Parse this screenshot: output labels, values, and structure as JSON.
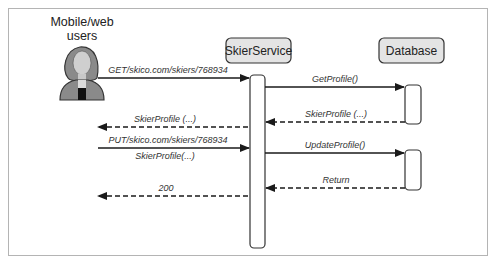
{
  "diagram": {
    "type": "sequence",
    "actor": {
      "label_line1": "Mobile/web",
      "label_line2": "users",
      "icon": "user-icon"
    },
    "participants": [
      {
        "id": "skierservice",
        "label": "SkierService"
      },
      {
        "id": "database",
        "label": "Database"
      }
    ],
    "messages": [
      {
        "from": "users",
        "to": "SkierService",
        "label": "GET/skico.com/skiers/768934",
        "style": "solid"
      },
      {
        "from": "SkierService",
        "to": "Database",
        "label": "GetProfile()",
        "style": "solid"
      },
      {
        "from": "Database",
        "to": "SkierService",
        "label": "SkierProfile (...)",
        "style": "dashed"
      },
      {
        "from": "SkierService",
        "to": "users",
        "label": "SkierProfile (...)",
        "style": "dashed"
      },
      {
        "from": "users",
        "to": "SkierService",
        "label": "PUT/skico.com/skiers/768934",
        "sublabel": "SkierProfile(...)",
        "style": "solid"
      },
      {
        "from": "SkierService",
        "to": "Database",
        "label": "UpdateProfile()",
        "style": "solid"
      },
      {
        "from": "Database",
        "to": "SkierService",
        "label": "Return",
        "style": "dashed"
      },
      {
        "from": "SkierService",
        "to": "users",
        "label": "200",
        "style": "dashed"
      }
    ],
    "colors": {
      "participant_fill": "#e4e4e4",
      "line": "#1a1a1a",
      "frame": "#b4b4b4"
    }
  }
}
